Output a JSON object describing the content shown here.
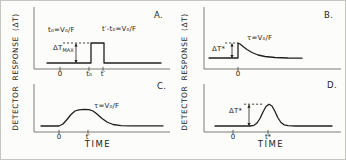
{
  "figure": {
    "left_axis_label": "DETECTOR RESPONSE (ΔT)",
    "right_axis_label": "DETECTOR RESPONSE (ΔT)",
    "line_color": "#1f1f1c",
    "axis_color": "#6e6e66",
    "background": "#fcfcfa"
  },
  "chart_data": [
    {
      "id": "a",
      "panel": "A.",
      "type": "line",
      "shape": "rectangular pulse: flat baseline, step up at t₀, flat top until t′, step back to baseline",
      "xlabel": "",
      "ylabel": "DETECTOR RESPONSE (ΔT)",
      "x_ticks": [
        "0",
        "t₀",
        "t′"
      ],
      "ann_left": "t₀=V₀/F",
      "ann_right": "t′-t₀=V₀/F",
      "delta_main": "ΔT",
      "delta_sub": "MAX",
      "geom": {
        "axis": [
          33,
          6,
          169,
          68
        ],
        "curve": [
          [
            46,
            62
          ],
          [
            90,
            62
          ],
          [
            90,
            42
          ],
          [
            103,
            42
          ],
          [
            103,
            62
          ],
          [
            160,
            62
          ]
        ],
        "dashed": [
          62,
          42,
          89,
          42
        ],
        "arrow": [
          75,
          42.5,
          62
        ],
        "tick_xs": [
          59,
          88,
          102
        ]
      }
    },
    {
      "id": "b",
      "panel": "B.",
      "type": "line",
      "shape": "impulse response: baseline, sharp rise at 0 to peak ΔT*, exponential decay with time constant τ back to baseline",
      "xlabel": "",
      "ylabel": "DETECTOR RESPONSE (ΔT)",
      "x_ticks": [
        "0"
      ],
      "ann": "τ=V₀/F",
      "delta": "ΔT*",
      "geom": {
        "axis": [
          203,
          6,
          340,
          68
        ],
        "curve": [
          [
            208,
            57
          ],
          [
            237,
            57
          ],
          [
            237,
            42
          ],
          [
            239,
            43
          ],
          [
            242,
            45.5
          ],
          [
            246,
            48.5
          ],
          [
            251,
            51.5
          ],
          [
            257,
            54
          ],
          [
            264,
            55.5
          ],
          [
            274,
            56.5
          ],
          [
            287,
            57
          ],
          [
            301,
            57.2
          ]
        ],
        "dashed": [
          224,
          42,
          237,
          42
        ],
        "arrow": [
          231,
          42.5,
          57
        ],
        "tick_xs": [
          237
        ]
      }
    },
    {
      "id": "c",
      "panel": "C.",
      "type": "line",
      "shape": "smoothed pulse: sigmoidal rise from 0, rounded plateau, smooth decay after t′ with time constant τ",
      "xlabel": "TIME",
      "ylabel": "DETECTOR RESPONSE (ΔT)",
      "x_ticks": [
        "0",
        "t′"
      ],
      "ann": "τ=V₀/F",
      "geom": {
        "axis": [
          33,
          83,
          169,
          131
        ],
        "curve": [
          [
            40,
            125
          ],
          [
            58,
            125
          ],
          [
            62,
            123
          ],
          [
            66,
            118.5
          ],
          [
            70,
            113.5
          ],
          [
            74,
            110
          ],
          [
            78,
            108.8
          ],
          [
            83,
            108.4
          ],
          [
            88,
            108.6
          ],
          [
            92,
            110
          ],
          [
            96,
            113
          ],
          [
            101,
            117.5
          ],
          [
            106,
            121
          ],
          [
            112,
            123.5
          ],
          [
            120,
            124.6
          ],
          [
            130,
            124.9
          ],
          [
            162,
            124.9
          ]
        ],
        "tick_xs": [
          58,
          87
        ]
      }
    },
    {
      "id": "d",
      "panel": "D.",
      "type": "line",
      "shape": "gaussian-like peak centered at t* with height ΔT* above baseline",
      "xlabel": "TIME",
      "ylabel": "DETECTOR RESPONSE (ΔT)",
      "x_ticks": [
        "0",
        "t*"
      ],
      "delta": "ΔT*",
      "geom": {
        "axis": [
          203,
          83,
          340,
          131
        ],
        "curve": [
          [
            214,
            125
          ],
          [
            249,
            125
          ],
          [
            253,
            124.3
          ],
          [
            256,
            122
          ],
          [
            259,
            117.5
          ],
          [
            262,
            111
          ],
          [
            265,
            105.5
          ],
          [
            268,
            103.2
          ],
          [
            271,
            105
          ],
          [
            274,
            110.5
          ],
          [
            277,
            117
          ],
          [
            280,
            121.5
          ],
          [
            283,
            123.8
          ],
          [
            287,
            124.7
          ],
          [
            295,
            125
          ],
          [
            331,
            125
          ]
        ],
        "dashed": [
          243,
          103.2,
          262,
          103.2
        ],
        "arrow": [
          248,
          103.7,
          125
        ],
        "tick_xs": [
          232,
          267
        ]
      }
    }
  ]
}
